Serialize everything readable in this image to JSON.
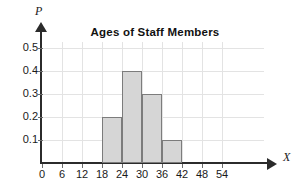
{
  "chart_data": {
    "type": "bar",
    "title": "Ages of Staff Members",
    "xlabel": "X",
    "ylabel": "P",
    "xlim": [
      0,
      57
    ],
    "ylim": [
      0,
      0.55
    ],
    "grid": true,
    "legend": null,
    "bin_width": 6,
    "bin_edges": [
      18,
      24,
      30,
      36,
      42
    ],
    "categories": [
      "18-24",
      "24-30",
      "30-36",
      "36-42"
    ],
    "values": [
      0.2,
      0.4,
      0.3,
      0.1
    ],
    "bars": [
      {
        "label": "18-24",
        "start": 18,
        "end": 24,
        "value": 0.2
      },
      {
        "label": "24-30",
        "start": 24,
        "end": 30,
        "value": 0.4
      },
      {
        "label": "30-36",
        "start": 30,
        "end": 36,
        "value": 0.3
      },
      {
        "label": "36-42",
        "start": 36,
        "end": 42,
        "value": 0.1
      }
    ],
    "x_ticks": [
      {
        "value": 0,
        "label": "0"
      },
      {
        "value": 6,
        "label": "6"
      },
      {
        "value": 12,
        "label": "12"
      },
      {
        "value": 18,
        "label": "18"
      },
      {
        "value": 24,
        "label": "24"
      },
      {
        "value": 30,
        "label": "30"
      },
      {
        "value": 36,
        "label": "36"
      },
      {
        "value": 42,
        "label": "42"
      },
      {
        "value": 48,
        "label": "48"
      },
      {
        "value": 54,
        "label": "54"
      }
    ],
    "y_ticks": [
      {
        "value": 0.1,
        "label": "0.1"
      },
      {
        "value": 0.2,
        "label": "0.2"
      },
      {
        "value": 0.3,
        "label": "0.3"
      },
      {
        "value": 0.4,
        "label": "0.4"
      },
      {
        "value": 0.5,
        "label": "0.5"
      }
    ],
    "colors": {
      "bar_fill": "#d6d6d6",
      "bar_stroke": "#7c7c7c",
      "axis": "#2b2b2b",
      "grid": "#e3e3e3",
      "background": "#ffffff",
      "text": "#1a1a1a"
    }
  }
}
